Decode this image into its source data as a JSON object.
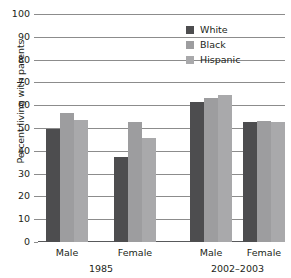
{
  "chart_data": {
    "type": "bar",
    "title": "",
    "xlabel": "",
    "ylabel": "Percent living with parents",
    "ylim": [
      0,
      100
    ],
    "ytick_values": [
      0,
      10,
      20,
      30,
      40,
      50,
      60,
      70,
      80,
      90,
      100
    ],
    "ytick_labels": [
      "0",
      "10",
      "20",
      "30",
      "40",
      "50",
      "60",
      "70",
      "80",
      "90",
      "100"
    ],
    "grid": true,
    "legend_position": "top-right",
    "legend_entries": [
      "White",
      "Black",
      "Hispanic"
    ],
    "series_colors": {
      "White": "#4d4d4f",
      "Black": "#9d9d9f",
      "Hispanic": "#a9a9ab"
    },
    "periods": [
      "1985",
      "2002–2003"
    ],
    "categories": [
      "Male",
      "Female",
      "Male",
      "Female"
    ],
    "category_periods": [
      "1985",
      "1985",
      "2002–2003",
      "2002–2003"
    ],
    "series": [
      {
        "name": "White",
        "values": [
          49.5,
          37.5,
          61.5,
          52.5
        ]
      },
      {
        "name": "Black",
        "values": [
          56.5,
          52.5,
          63.0,
          53.0
        ]
      },
      {
        "name": "Hispanic",
        "values": [
          53.5,
          45.5,
          64.5,
          52.5
        ]
      }
    ]
  },
  "axis": {
    "y_title": "Percent living with parents"
  },
  "legend": {
    "items": [
      {
        "label": "White",
        "swatch": "legend-swatch-white"
      },
      {
        "label": "Black",
        "swatch": "legend-swatch-black"
      },
      {
        "label": "Hispanic",
        "swatch": "legend-swatch-hispanic"
      }
    ]
  },
  "groups": [
    {
      "label": "Male",
      "period": "1985"
    },
    {
      "label": "Female",
      "period": "1985"
    },
    {
      "label": "Male",
      "period": "2002–2003"
    },
    {
      "label": "Female",
      "period": "2002–2003"
    }
  ],
  "periods": [
    {
      "label": "1985"
    },
    {
      "label": "2002–2003"
    }
  ]
}
